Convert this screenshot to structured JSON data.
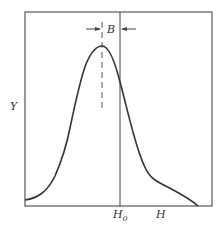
{
  "diagram": {
    "type": "resonance-line-profile",
    "axes": {
      "y_label": "Y",
      "x_label": "H",
      "x_marker_label": "H",
      "x_marker_subscript": "0"
    },
    "annotations": {
      "width_label": "B"
    },
    "colors": {
      "line": "#333333",
      "frame": "#555555",
      "background": "#ffffff"
    }
  }
}
